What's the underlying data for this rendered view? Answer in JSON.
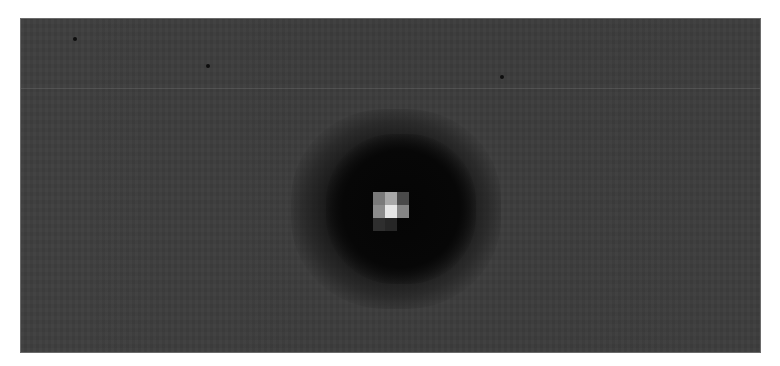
{
  "image": {
    "description": "Grayscale sensor/astronomical image showing a single bright point source surrounded by a dark halo on a uniform gray background",
    "colors": {
      "page_background": "#ffffff",
      "field_background": "#3e3e3e",
      "halo_core": "#050505",
      "frame_border": "#6a6a6a"
    },
    "star_pixels": [
      {
        "col": 0,
        "row": 0,
        "color": "#7a7a7a"
      },
      {
        "col": 1,
        "row": 0,
        "color": "#a8a8a8"
      },
      {
        "col": 2,
        "row": 0,
        "color": "#4a4a4a"
      },
      {
        "col": 0,
        "row": 1,
        "color": "#8c8c8c"
      },
      {
        "col": 1,
        "row": 1,
        "color": "#e6e6e6"
      },
      {
        "col": 2,
        "row": 1,
        "color": "#858585"
      },
      {
        "col": 0,
        "row": 2,
        "color": "#2e2e2e"
      },
      {
        "col": 1,
        "row": 2,
        "color": "#262626"
      }
    ],
    "dark_spots": [
      {
        "x": 52,
        "y": 18
      },
      {
        "x": 185,
        "y": 45
      },
      {
        "x": 479,
        "y": 56
      }
    ],
    "streak_y": 69
  }
}
